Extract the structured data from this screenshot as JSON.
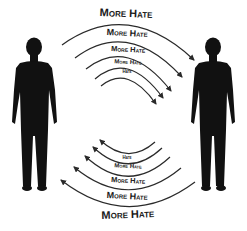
{
  "diagram": {
    "figures": [
      {
        "name": "left-person",
        "side": "left"
      },
      {
        "name": "right-person",
        "side": "right"
      }
    ],
    "top_arcs": {
      "direction": "left-to-right",
      "labels": [
        "More Hate",
        "More Hate",
        "More Hate",
        "More Hate",
        "Hate"
      ]
    },
    "bottom_arcs": {
      "direction": "right-to-left",
      "labels": [
        "Hate",
        "More Hate",
        "More Hate",
        "More Hate",
        "More Hate"
      ]
    },
    "colors": {
      "silhouette": "#111111",
      "arrow": "#2a2a2a",
      "text": "#1a1a1a",
      "background": "#ffffff"
    }
  }
}
